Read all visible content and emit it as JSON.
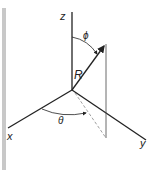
{
  "diagram": {
    "type": "spherical-coordinates",
    "labels": {
      "z_axis": "z",
      "x_axis": "x",
      "y_axis": "y",
      "radius": "R",
      "polar_angle": "ϕ",
      "azimuth_angle": "θ"
    },
    "colors": {
      "line": "#222222",
      "side_bar": "#c8c8c8",
      "dashed": "#888888"
    }
  }
}
